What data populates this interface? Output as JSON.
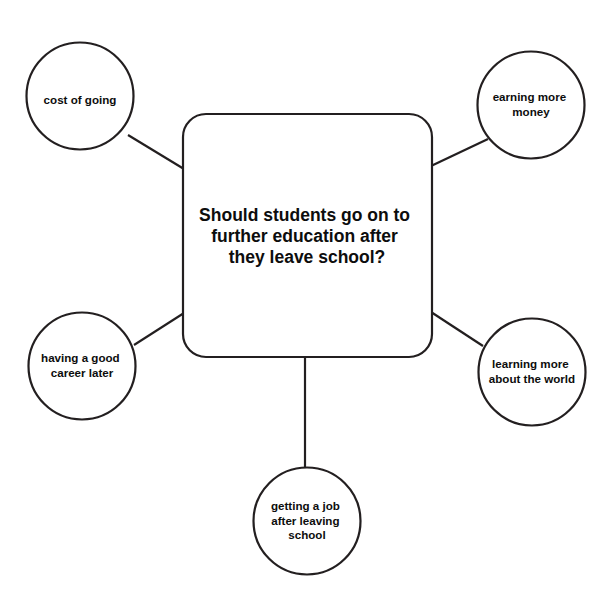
{
  "diagram": {
    "type": "mind-map",
    "background_color": "#ffffff",
    "stroke_color": "#231f20",
    "text_color": "#0d0d0d",
    "central_node": {
      "shape": "rounded-rectangle",
      "lines": [
        "Should students go on to",
        "further education after",
        "they leave school?"
      ]
    },
    "branches": [
      {
        "id": "cost-of-going",
        "position": "top-left",
        "shape": "circle",
        "lines": [
          "cost of going"
        ]
      },
      {
        "id": "earning-more-money",
        "position": "top-right",
        "shape": "circle",
        "lines": [
          "earning more",
          "money"
        ]
      },
      {
        "id": "having-a-good-career-later",
        "position": "bottom-left",
        "shape": "circle",
        "lines": [
          "having a good",
          "career later"
        ]
      },
      {
        "id": "learning-more-about-the-world",
        "position": "bottom-right",
        "shape": "circle",
        "lines": [
          "learning more",
          "about the world"
        ]
      },
      {
        "id": "getting-a-job-after-leaving-school",
        "position": "bottom-center",
        "shape": "circle",
        "lines": [
          "getting a job",
          "after leaving",
          "school"
        ]
      }
    ]
  }
}
